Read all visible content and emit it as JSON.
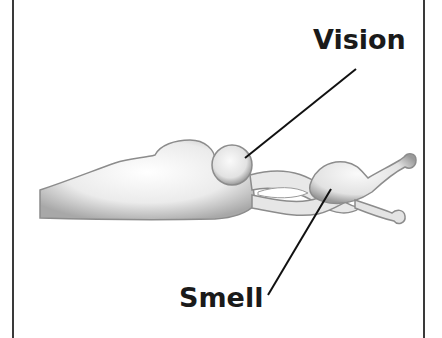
{
  "diagram": {
    "labels": {
      "vision": "Vision",
      "smell": "Smell"
    },
    "colors": {
      "border": "#3a3a3a",
      "text": "#1a1a1a",
      "brain_fill": "#ececec",
      "brain_shadow": "#9a9a9a",
      "leader_line": "#111111"
    }
  }
}
